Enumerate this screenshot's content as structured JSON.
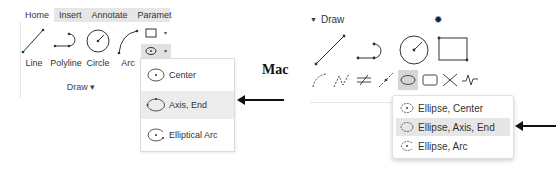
{
  "windows": {
    "tabs": [
      {
        "label": "Home",
        "active": true
      },
      {
        "label": "Insert",
        "active": false
      },
      {
        "label": "Annotate",
        "active": false
      },
      {
        "label": "Paramet",
        "active": false
      }
    ],
    "tools": [
      {
        "label": "Line",
        "icon": "line-icon"
      },
      {
        "label": "Polyline",
        "icon": "polyline-icon"
      },
      {
        "label": "Circle",
        "icon": "circle-icon"
      },
      {
        "label": "Arc",
        "icon": "arc-icon"
      }
    ],
    "small_tools": [
      {
        "icon": "rectangle-icon",
        "caret": "▾"
      },
      {
        "icon": "ellipse-icon",
        "caret": "▾"
      }
    ],
    "group_label": "Draw ▾",
    "ellipse_menu": [
      {
        "label": "Center",
        "highlighted": false
      },
      {
        "label": "Axis, End",
        "highlighted": true
      },
      {
        "label": "Elliptical Arc",
        "highlighted": false
      }
    ]
  },
  "platform_label": "Mac",
  "mac": {
    "panel_title": "Draw",
    "panel_toggle": "▼",
    "gear_glyph": "✹",
    "ellipse_menu": [
      {
        "label": "Ellipse, Center",
        "highlighted": false
      },
      {
        "label": "Ellipse, Axis, End",
        "highlighted": true
      },
      {
        "label": "Ellipse, Arc",
        "highlighted": false
      }
    ]
  },
  "colors": {
    "tab_bar": "#e6e6e6",
    "highlight": "#ececec",
    "mac_selected": "#d6d6d6",
    "arrow": "#111111"
  }
}
